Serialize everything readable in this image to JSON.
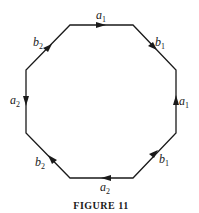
{
  "figure": {
    "caption": "FIGURE 11",
    "shape": "octagon",
    "edges": [
      {
        "id": "top",
        "label": "a",
        "sub": "1",
        "direction": "right"
      },
      {
        "id": "top-right",
        "label": "b",
        "sub": "1",
        "direction": "down-right"
      },
      {
        "id": "right",
        "label": "a",
        "sub": "1",
        "direction": "up"
      },
      {
        "id": "bottom-right",
        "label": "b",
        "sub": "1",
        "direction": "up-right"
      },
      {
        "id": "bottom",
        "label": "a",
        "sub": "2",
        "direction": "left"
      },
      {
        "id": "bottom-left",
        "label": "b",
        "sub": "2",
        "direction": "up-left"
      },
      {
        "id": "left",
        "label": "a",
        "sub": "2",
        "direction": "down"
      },
      {
        "id": "top-left",
        "label": "b",
        "sub": "2",
        "direction": "up-right"
      }
    ],
    "colors": {
      "stroke": "#1a1a1a",
      "background": "#ffffff"
    }
  }
}
